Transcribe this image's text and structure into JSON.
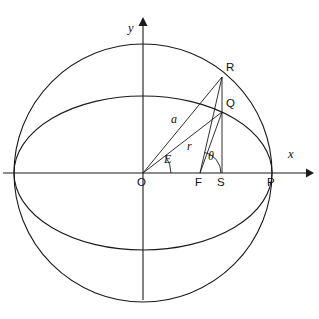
{
  "figure": {
    "background_color": "#ffffff",
    "stroke_color": "#1a1a1a",
    "width": 319,
    "height": 319
  },
  "axes": {
    "x_label": "x",
    "y_label": "y",
    "origin_label": "O",
    "x_axis": {
      "y": 173,
      "x_start": 3,
      "x_end": 313
    },
    "y_axis": {
      "x": 143,
      "y_start": 18,
      "y_end": 300
    }
  },
  "points": [
    {
      "id": "O",
      "label": "O",
      "x": 143,
      "y": 173,
      "desc": "center-of-ellipse-origin"
    },
    {
      "id": "F",
      "label": "F",
      "x": 200,
      "y": 173,
      "desc": "focus"
    },
    {
      "id": "S",
      "label": "S",
      "x": 222,
      "y": 173,
      "desc": "foot-of-perpendicular"
    },
    {
      "id": "P",
      "label": "P",
      "x": 272,
      "y": 173,
      "desc": "perihelion"
    },
    {
      "id": "R",
      "label": "R",
      "x": 222,
      "y": 77,
      "desc": "point-on-auxiliary-circle"
    },
    {
      "id": "Q",
      "label": "Q",
      "x": 222,
      "y": 112,
      "desc": "point-on-ellipse"
    }
  ],
  "curves": {
    "circle": {
      "cx": 143,
      "cy": 173,
      "r": 129,
      "name": "auxiliary-circle"
    },
    "ellipse": {
      "cx": 143,
      "cy": 173,
      "rx": 129,
      "ry": 77,
      "name": "orbit-ellipse"
    }
  },
  "segments": [
    {
      "id": "OR",
      "from": "O",
      "to": "R",
      "label": "a",
      "label_x": 173,
      "label_y": 118
    },
    {
      "id": "OQ",
      "from": "O",
      "to": "Q",
      "label": "r",
      "label_x": 189,
      "label_y": 145
    },
    {
      "id": "FR",
      "from": "F",
      "to": "R",
      "label": "",
      "label_x": 0,
      "label_y": 0
    },
    {
      "id": "FQ",
      "from": "F",
      "to": "Q",
      "label": "",
      "label_x": 0,
      "label_y": 0
    },
    {
      "id": "RS",
      "from": "R",
      "to": "S",
      "label": "",
      "label_x": 0,
      "label_y": 0
    }
  ],
  "angles": [
    {
      "id": "E",
      "label": "E",
      "vertex": "O",
      "label_x": 166,
      "label_y": 158,
      "desc": "eccentric-anomaly"
    },
    {
      "id": "theta",
      "label": "θ",
      "vertex": "F",
      "label_x": 210,
      "label_y": 155,
      "desc": "true-anomaly"
    }
  ]
}
